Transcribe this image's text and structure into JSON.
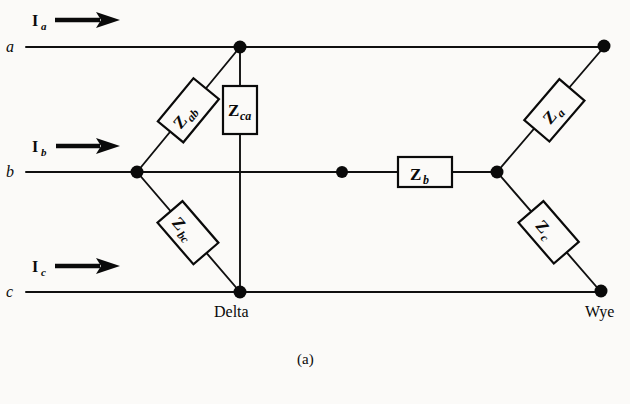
{
  "figure": {
    "caption": "(a)",
    "background_color": "#fbfaf8",
    "ink_color": "#0a0a0a",
    "width": 630,
    "height": 404
  },
  "terminals": [
    {
      "id": "a",
      "label": "a",
      "y": 47
    },
    {
      "id": "b",
      "label": "b",
      "y": 172
    },
    {
      "id": "c",
      "label": "c",
      "y": 292
    }
  ],
  "currents": [
    {
      "id": "Ia",
      "symbol": "I",
      "subscript": "a",
      "direction": "right"
    },
    {
      "id": "Ib",
      "symbol": "I",
      "subscript": "b",
      "direction": "right"
    },
    {
      "id": "Ic",
      "symbol": "I",
      "subscript": "c",
      "direction": "right"
    }
  ],
  "impedances": [
    {
      "id": "Zab",
      "symbol": "Z",
      "subscript": "ab",
      "connection": "delta",
      "between": [
        "b",
        "a"
      ]
    },
    {
      "id": "Zca",
      "symbol": "Z",
      "subscript": "ca",
      "connection": "delta",
      "between": [
        "c",
        "a"
      ]
    },
    {
      "id": "Zbc",
      "symbol": "Z",
      "subscript": "bc",
      "connection": "delta",
      "between": [
        "b",
        "c"
      ]
    },
    {
      "id": "Za",
      "symbol": "Z",
      "subscript": "a",
      "connection": "wye",
      "between": [
        "neutral",
        "a"
      ]
    },
    {
      "id": "Zb",
      "symbol": "Z",
      "subscript": "b",
      "connection": "wye",
      "between": [
        "b",
        "neutral"
      ]
    },
    {
      "id": "Zc",
      "symbol": "Z",
      "subscript": "c",
      "connection": "wye",
      "between": [
        "neutral",
        "c"
      ]
    }
  ],
  "network_labels": [
    {
      "id": "delta",
      "text": "Delta"
    },
    {
      "id": "wye",
      "text": "Wye"
    }
  ]
}
